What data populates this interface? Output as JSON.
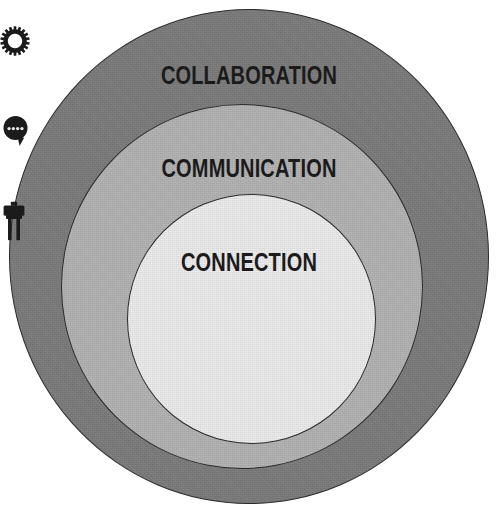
{
  "diagram": {
    "type": "concentric-circles",
    "background_color": "#ffffff",
    "outline_color": "#2b2b2b",
    "text_color": "#1b1b1b",
    "layers": [
      {
        "key": "collaboration",
        "label": "COLLABORATION",
        "icon": "gear-icon",
        "level": 3,
        "position": "outer",
        "fill_color": "#7d7d7d"
      },
      {
        "key": "communication",
        "label": "COMMUNICATION",
        "icon": "speech-bubble-icon",
        "level": 2,
        "position": "middle",
        "fill_color": "#b4b4b4"
      },
      {
        "key": "connection",
        "label": "CONNECTION",
        "icon": "plug-icon",
        "level": 1,
        "position": "inner",
        "fill_color": "#ededed"
      }
    ]
  }
}
